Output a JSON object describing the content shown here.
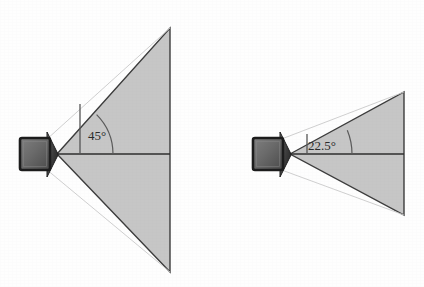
{
  "figure": {
    "background_color": "#fefefe",
    "width": 424,
    "height": 287
  },
  "style": {
    "cone_fill": "#c6c6c6",
    "cone_stroke": "#3c3c3c",
    "axis_color": "#2e2e2e",
    "ray_color": "#b9b9b9",
    "arc_color": "#4a4a4a",
    "label_color": "#2b2b2b",
    "camera_body_dark": "#3a3a3a",
    "camera_body_light": "#7c7c7c",
    "camera_lens_dark": "#2f2f2f",
    "camera_lens_light": "#6e6e6e"
  },
  "diagrams": [
    {
      "id": "wide-angle",
      "name": "wide-field-of-view-camera",
      "angle_label": "45°",
      "angle_value": 45,
      "angle_unit": "degrees",
      "camera": {
        "body_x": 20,
        "body_y": 138,
        "body_w": 30,
        "body_h": 32,
        "lens_tip_x": 57,
        "lens_tip_y": 154
      },
      "cone": {
        "apex_x": 57,
        "apex_y": 154,
        "top_x": 170,
        "top_y": 28,
        "bottom_x": 170,
        "bottom_y": 272
      },
      "axis": {
        "x1": 57,
        "y1": 154,
        "x2": 170,
        "y2": 154
      },
      "marker": {
        "vertical_x": 80,
        "vertical_y_top": 104,
        "vertical_y_bottom": 155,
        "arc_radius": 56,
        "label_x": 88,
        "label_y": 140
      }
    },
    {
      "id": "narrow-angle",
      "name": "narrow-field-of-view-camera",
      "angle_label": "22.5°",
      "angle_value": 22.5,
      "angle_unit": "degrees",
      "camera": {
        "body_x": 253,
        "body_y": 138,
        "body_w": 30,
        "body_h": 32,
        "lens_tip_x": 290,
        "lens_tip_y": 154
      },
      "cone": {
        "apex_x": 290,
        "apex_y": 154,
        "top_x": 404,
        "top_y": 92,
        "bottom_x": 404,
        "bottom_y": 215
      },
      "axis": {
        "x1": 290,
        "y1": 154,
        "x2": 404,
        "y2": 154
      },
      "marker": {
        "vertical_x": 307,
        "vertical_y_top": 134,
        "vertical_y_bottom": 155,
        "arc_radius": 62,
        "label_x": 308,
        "label_y": 150
      }
    }
  ]
}
